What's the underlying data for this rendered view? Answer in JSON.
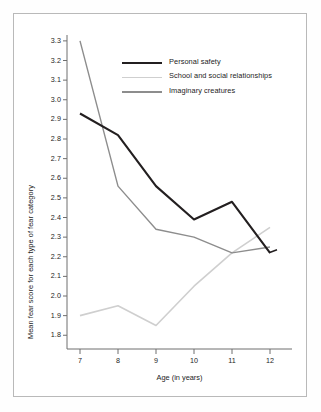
{
  "chart_data": {
    "type": "line",
    "title": "",
    "subtitle": "",
    "xlabel": "Age (in years)",
    "ylabel": "Mean fear score for each type of fear category",
    "x": [
      7,
      8,
      9,
      10,
      11,
      12
    ],
    "categories": [
      "7",
      "8",
      "9",
      "10",
      "11",
      "12"
    ],
    "xtick_labels": [
      "7",
      "8",
      "9",
      "10",
      "11",
      "12"
    ],
    "ytick_labels": [
      "3.3",
      "3.2",
      "3.1",
      "3.0",
      "2.9",
      "2.8",
      "2.7",
      "2.6",
      "2.5",
      "2.4",
      "2.3",
      "2.2",
      "2.1",
      "2.0",
      "1.9",
      "1.8"
    ],
    "ytick_values": [
      3.3,
      3.2,
      3.1,
      3.0,
      2.9,
      2.8,
      2.7,
      2.6,
      2.5,
      2.4,
      2.3,
      2.2,
      2.1,
      2.0,
      1.9,
      1.8
    ],
    "xlim": [
      6.6,
      12.5
    ],
    "ylim": [
      1.73,
      3.33
    ],
    "grid": false,
    "legend_position": "upper-center",
    "series": [
      {
        "name": "Personal safety",
        "color": "#231f20",
        "width": 2.1,
        "values": [
          2.93,
          2.82,
          2.56,
          2.39,
          2.48,
          2.22
        ]
      },
      {
        "name": "School and social relationships",
        "color": "#cfcfcf",
        "width": 1.6,
        "values": [
          1.9,
          1.95,
          1.85,
          2.05,
          2.22,
          2.35
        ]
      },
      {
        "name": "Imaginary creatures",
        "color": "#8d8d8d",
        "width": 1.4,
        "values": [
          3.3,
          2.56,
          2.34,
          2.3,
          2.22,
          2.25
        ]
      }
    ]
  },
  "legend": {
    "items": [
      {
        "label": "Personal safety",
        "color": "#231f20"
      },
      {
        "label": "School and social relationships",
        "color": "#cfcfcf"
      },
      {
        "label": "Imaginary creatures",
        "color": "#8d8d8d"
      }
    ]
  },
  "axes": {
    "x_title": "Age (in years)",
    "y_title": "Mean fear score for each type of fear category"
  }
}
